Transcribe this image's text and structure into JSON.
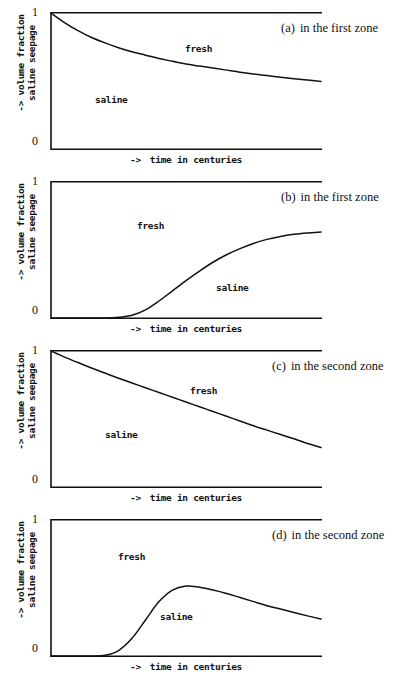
{
  "figure": {
    "axis_labels": {
      "y_line1": "-> volume fraction",
      "y_line2": "saline seepage",
      "x_arrow": "->",
      "x_text": "time in centuries",
      "tick_top": "1",
      "tick_bottom": "0"
    },
    "region_labels": {
      "fresh": "fresh",
      "saline": "saline"
    },
    "line_color": "#111111",
    "background_color": "#ffffff"
  },
  "panels": [
    {
      "tag": "(a)",
      "caption": "in the first zone",
      "fresh_pos": {
        "left": "135px",
        "top": "31px"
      },
      "saline_pos": {
        "left": "45px",
        "top": "82px"
      }
    },
    {
      "tag": "(b)",
      "caption": "in the first zone",
      "fresh_pos": {
        "left": "87px",
        "top": "39px"
      },
      "saline_pos": {
        "left": "166px",
        "top": "101px"
      }
    },
    {
      "tag": "(c)",
      "caption": "in the second zone",
      "fresh_pos": {
        "left": "140px",
        "top": "35px"
      },
      "saline_pos": {
        "left": "55px",
        "top": "79px"
      }
    },
    {
      "tag": "(d)",
      "caption": "in the second zone",
      "fresh_pos": {
        "left": "68px",
        "top": "32px"
      },
      "saline_pos": {
        "left": "110px",
        "top": "92px"
      }
    }
  ],
  "chart_data": {
    "type": "line",
    "xlabel": "-> time in centuries",
    "ylabel": "-> volume fraction saline seepage",
    "xlim": [
      0,
      1
    ],
    "ylim": [
      0,
      1
    ],
    "yticks": [
      0,
      1
    ],
    "ytick_labels": [
      "0",
      "1"
    ],
    "xticks": [],
    "grid": false,
    "legend": "none",
    "panels": [
      {
        "tag": "(a)",
        "caption": "in the first zone",
        "description": "monotonic decay of saline fraction from 1 toward about 0.49",
        "x": [
          0.0,
          0.05,
          0.1,
          0.15,
          0.2,
          0.25,
          0.3,
          0.35,
          0.4,
          0.45,
          0.5,
          0.55,
          0.6,
          0.65,
          0.7,
          0.75,
          0.8,
          0.85,
          0.9,
          0.95,
          1.0
        ],
        "y": [
          1.0,
          0.93,
          0.87,
          0.82,
          0.78,
          0.745,
          0.715,
          0.69,
          0.665,
          0.645,
          0.625,
          0.61,
          0.595,
          0.58,
          0.565,
          0.552,
          0.54,
          0.528,
          0.517,
          0.507,
          0.497
        ],
        "annotations": [
          {
            "text": "fresh",
            "x": 0.5,
            "y": 0.83
          },
          {
            "text": "saline",
            "x": 0.16,
            "y": 0.45
          }
        ]
      },
      {
        "tag": "(b)",
        "caption": "in the first zone",
        "description": "saline fraction stays at 0 then rises as an S-curve toward about 0.63",
        "x": [
          0.0,
          0.05,
          0.1,
          0.15,
          0.2,
          0.25,
          0.3,
          0.35,
          0.4,
          0.45,
          0.5,
          0.55,
          0.6,
          0.65,
          0.7,
          0.75,
          0.8,
          0.85,
          0.9,
          0.95,
          1.0
        ],
        "y": [
          0.0,
          0.0,
          0.0,
          0.0,
          0.0,
          0.005,
          0.02,
          0.06,
          0.125,
          0.2,
          0.275,
          0.345,
          0.41,
          0.465,
          0.51,
          0.548,
          0.578,
          0.6,
          0.615,
          0.625,
          0.632
        ],
        "annotations": [
          {
            "text": "fresh",
            "x": 0.3,
            "y": 0.72
          },
          {
            "text": "saline",
            "x": 0.6,
            "y": 0.28
          }
        ]
      },
      {
        "tag": "(c)",
        "caption": "in the second zone",
        "description": "slower, nearly linear decay of saline fraction from 1 toward about 0.29",
        "x": [
          0.0,
          0.05,
          0.1,
          0.15,
          0.2,
          0.25,
          0.3,
          0.35,
          0.4,
          0.45,
          0.5,
          0.55,
          0.6,
          0.65,
          0.7,
          0.75,
          0.8,
          0.85,
          0.9,
          0.95,
          1.0
        ],
        "y": [
          1.0,
          0.955,
          0.915,
          0.875,
          0.838,
          0.8,
          0.765,
          0.73,
          0.695,
          0.66,
          0.625,
          0.59,
          0.555,
          0.52,
          0.485,
          0.45,
          0.418,
          0.386,
          0.355,
          0.32,
          0.29
        ],
        "annotations": [
          {
            "text": "fresh",
            "x": 0.52,
            "y": 0.78
          },
          {
            "text": "saline",
            "x": 0.21,
            "y": 0.46
          }
        ]
      },
      {
        "tag": "(d)",
        "caption": "in the second zone",
        "description": "saline fraction stays at 0, rises steeply to a peak near 0.52 then decays toward about 0.27",
        "x": [
          0.0,
          0.05,
          0.1,
          0.15,
          0.2,
          0.25,
          0.3,
          0.35,
          0.4,
          0.45,
          0.5,
          0.55,
          0.6,
          0.65,
          0.7,
          0.75,
          0.8,
          0.85,
          0.9,
          0.95,
          1.0
        ],
        "y": [
          0.0,
          0.0,
          0.0,
          0.0,
          0.005,
          0.04,
          0.13,
          0.265,
          0.4,
          0.485,
          0.515,
          0.505,
          0.485,
          0.46,
          0.43,
          0.4,
          0.37,
          0.345,
          0.32,
          0.295,
          0.272
        ],
        "annotations": [
          {
            "text": "fresh",
            "x": 0.2,
            "y": 0.8
          },
          {
            "text": "saline",
            "x": 0.4,
            "y": 0.36
          }
        ]
      }
    ]
  }
}
